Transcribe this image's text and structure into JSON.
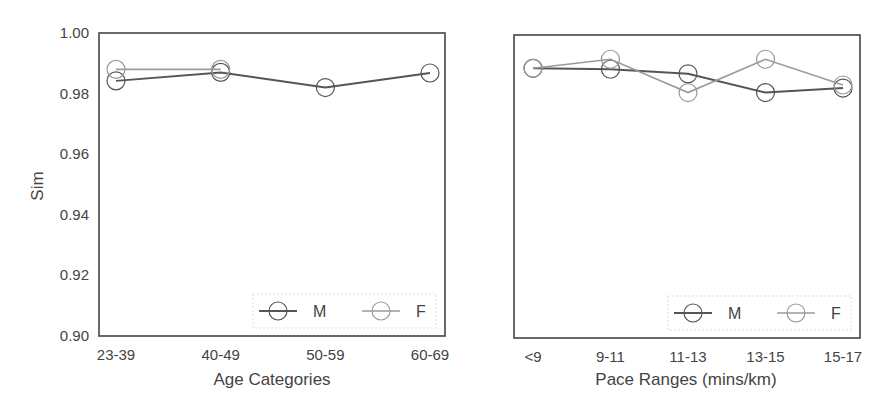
{
  "chart_data": [
    {
      "type": "line",
      "title": "",
      "xlabel": "Age Categories",
      "ylabel": "Sim",
      "ylim": [
        0.9,
        1.0
      ],
      "yticks": [
        "0.90",
        "0.92",
        "0.94",
        "0.96",
        "0.98",
        "1.00"
      ],
      "categories": [
        "23-39",
        "40-49",
        "50-59",
        "60-69"
      ],
      "grid": false,
      "legend_position": "lower right",
      "series": [
        {
          "name": "M",
          "color": "#555555",
          "marker": "open-circle",
          "values": [
            0.9842,
            0.987,
            0.982,
            0.9868
          ]
        },
        {
          "name": "F",
          "color": "#9a9a9a",
          "marker": "open-circle",
          "values": [
            0.988,
            0.988,
            null,
            null
          ]
        }
      ]
    },
    {
      "type": "line",
      "title": "",
      "xlabel": "Pace Ranges (mins/km)",
      "ylabel": "",
      "ylim": [
        0.9,
        1.0
      ],
      "yticks": [],
      "categories": [
        "<9",
        "9-11",
        "11-13",
        "13-15",
        "15-17"
      ],
      "grid": false,
      "legend_position": "lower right",
      "series": [
        {
          "name": "M",
          "color": "#555555",
          "marker": "open-circle",
          "values": [
            0.989,
            0.9887,
            0.9872,
            0.981,
            0.9825
          ]
        },
        {
          "name": "F",
          "color": "#9a9a9a",
          "marker": "open-circle",
          "values": [
            0.989,
            0.992,
            0.981,
            0.992,
            0.9835
          ]
        }
      ]
    }
  ]
}
